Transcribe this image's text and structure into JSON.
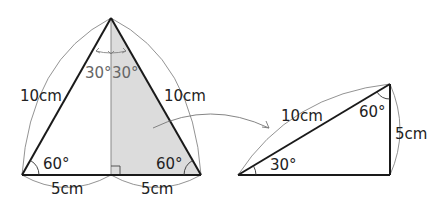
{
  "figure": {
    "left_triangle": {
      "type": "equilateral triangle split by altitude",
      "side_left": "10cm",
      "side_right": "10cm",
      "base_left": "5cm",
      "base_right": "5cm",
      "angle_bottom_left": "60°",
      "angle_bottom_right": "60°",
      "angle_top_left": "30°",
      "angle_top_right": "30°",
      "shaded_half": "right"
    },
    "right_triangle": {
      "hypotenuse": "10cm",
      "vertical_side": "5cm",
      "angle_left": "30°",
      "angle_top": "60°"
    },
    "colors": {
      "stroke": "#1a1a1a",
      "shade": "#dcdcdc",
      "thin_line": "#777777",
      "gray_text": "#666666"
    }
  }
}
